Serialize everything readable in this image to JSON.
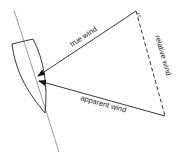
{
  "diagram": {
    "labels": {
      "true_wind": "true wind",
      "relative_wind": "relative wind",
      "apparent_wind": "apparent wind"
    },
    "colors": {
      "stroke": "#222222",
      "background": "#ffffff"
    }
  }
}
